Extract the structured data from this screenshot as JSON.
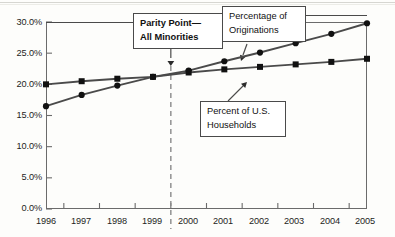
{
  "chart_data": {
    "type": "line",
    "title": "",
    "xlabel": "",
    "ylabel": "",
    "x": [
      1996,
      1997,
      1998,
      1999,
      2000,
      2001,
      2002,
      2003,
      2004,
      2005
    ],
    "xtick_labels": [
      "1996",
      "1997",
      "1998",
      "1999",
      "2000",
      "2001",
      "2002",
      "2003",
      "2004",
      "2005"
    ],
    "ytick_labels": [
      "0.0%",
      "5.0%",
      "10.0%",
      "15.0%",
      "20.0%",
      "25.0%",
      "30.0%"
    ],
    "ytick_values": [
      0,
      5,
      10,
      15,
      20,
      25,
      30
    ],
    "ylim": [
      0,
      30
    ],
    "xlim": [
      1996,
      2005
    ],
    "grid": false,
    "legend": "none (series labeled by callout boxes)",
    "series": [
      {
        "name": "Percentage of Originations",
        "marker": "circle",
        "values": [
          16.5,
          18.3,
          19.8,
          21.2,
          22.2,
          23.7,
          25.1,
          26.6,
          28.1,
          29.8
        ]
      },
      {
        "name": "Percent of U.S. Households",
        "marker": "square",
        "values": [
          20.0,
          20.5,
          20.9,
          21.2,
          21.9,
          22.4,
          22.8,
          23.2,
          23.6,
          24.1
        ]
      }
    ],
    "annotations": [
      {
        "id": "parity-point",
        "label_line1": "Parity Point—",
        "label_line2": "All Minorities",
        "pointer": "arrow-down",
        "at_x": 1999.5,
        "at_y": 21.8,
        "marker": "dashed vertical line at 1999.5"
      },
      {
        "id": "percentage-of-originations",
        "label_line1": "Percentage of",
        "label_line2": "Originations",
        "pointer": "arrow-down",
        "at_x": 2000.6,
        "at_y": 22.6
      },
      {
        "id": "percent-of-us-households",
        "label_line1": "Percent of U.S.",
        "label_line2": "Households",
        "pointer": "arrow-up-left",
        "at_x": 2001.2,
        "at_y": 22.5
      }
    ],
    "colors": {
      "axis": "#6b6b6b",
      "series_line": "#4a4a4a",
      "marker": "#111111",
      "callout_border": "#4a4a4a",
      "dashed_line": "#8a8a8a",
      "background": "#fdfdfb"
    }
  }
}
